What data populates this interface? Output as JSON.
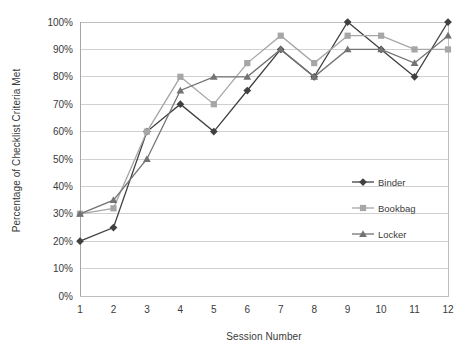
{
  "chart_data": {
    "type": "line",
    "title": "",
    "xlabel": "Session Number",
    "ylabel": "Percentage of Checklist Criteria Met",
    "x": [
      1,
      2,
      3,
      4,
      5,
      6,
      7,
      8,
      9,
      10,
      11,
      12
    ],
    "xtick_labels": [
      "1",
      "2",
      "3",
      "4",
      "5",
      "6",
      "7",
      "8",
      "9",
      "10",
      "11",
      "12"
    ],
    "ytick_labels": [
      "0%",
      "10%",
      "20%",
      "30%",
      "40%",
      "50%",
      "60%",
      "70%",
      "80%",
      "90%",
      "100%"
    ],
    "ytick_values": [
      0,
      10,
      20,
      30,
      40,
      50,
      60,
      70,
      80,
      90,
      100
    ],
    "ylim": [
      0,
      100
    ],
    "xlim": [
      1,
      12
    ],
    "grid": true,
    "legend_position": "right",
    "series": [
      {
        "name": "Binder",
        "marker": "diamond",
        "color": "#404040",
        "values": [
          20,
          25,
          60,
          70,
          60,
          75,
          90,
          80,
          100,
          90,
          80,
          100
        ]
      },
      {
        "name": "Bookbag",
        "marker": "square",
        "color": "#a6a6a6",
        "values": [
          30,
          32,
          60,
          80,
          70,
          85,
          95,
          85,
          95,
          95,
          90,
          90
        ]
      },
      {
        "name": "Locker",
        "marker": "triangle",
        "color": "#737373",
        "values": [
          30,
          35,
          50,
          75,
          80,
          80,
          90,
          80,
          90,
          90,
          85,
          95
        ]
      }
    ]
  },
  "legend": {
    "items": [
      {
        "label": "Binder"
      },
      {
        "label": "Bookbag"
      },
      {
        "label": "Locker"
      }
    ]
  },
  "colors": {
    "binder": "#404040",
    "bookbag": "#a6a6a6",
    "locker": "#737373",
    "gridline": "#d0d0d0",
    "axis": "#a6a6a6",
    "text": "#3a3a3a",
    "background": "#ffffff"
  }
}
